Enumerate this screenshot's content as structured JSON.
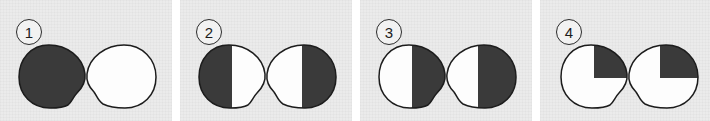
{
  "figure": {
    "type": "stimulus-strip",
    "panel_count": 4,
    "background_color": "#ebebeb",
    "page_background": "#ffffff",
    "dark_fill": "#3a3a3a",
    "light_fill": "#fdfdfd",
    "outline_color": "#1c1c1c",
    "panels": [
      {
        "number": "1",
        "shapes": [
          {
            "role": "left-blob",
            "outline": "convex-bump-lower-right",
            "shading": "full-dark",
            "dark_fraction": 1.0,
            "shaded_regions": [
              "whole"
            ]
          },
          {
            "role": "right-blob",
            "outline": "concave-notch-lower-left",
            "shading": "full-light",
            "dark_fraction": 0.0,
            "shaded_regions": []
          }
        ]
      },
      {
        "number": "2",
        "shapes": [
          {
            "role": "left-blob",
            "outline": "convex-bump-lower-right",
            "shading": "half-vertical",
            "dark_fraction": 0.5,
            "shaded_regions": [
              "left-half"
            ]
          },
          {
            "role": "right-blob",
            "outline": "concave-notch-lower-left",
            "shading": "half-vertical",
            "dark_fraction": 0.5,
            "shaded_regions": [
              "right-half"
            ]
          }
        ]
      },
      {
        "number": "3",
        "shapes": [
          {
            "role": "left-blob",
            "outline": "convex-bump-lower-right",
            "shading": "half-vertical",
            "dark_fraction": 0.5,
            "shaded_regions": [
              "right-half"
            ]
          },
          {
            "role": "right-blob",
            "outline": "concave-notch-lower-left",
            "shading": "half-vertical",
            "dark_fraction": 0.5,
            "shaded_regions": [
              "right-half"
            ]
          }
        ]
      },
      {
        "number": "4",
        "shapes": [
          {
            "role": "left-blob",
            "outline": "convex-bump-lower-right",
            "shading": "quarter",
            "dark_fraction": 0.25,
            "shaded_regions": [
              "upper-right-quadrant"
            ]
          },
          {
            "role": "right-blob",
            "outline": "concave-notch-lower-left",
            "shading": "quarter",
            "dark_fraction": 0.25,
            "shaded_regions": [
              "upper-right-quadrant"
            ]
          }
        ]
      }
    ]
  }
}
